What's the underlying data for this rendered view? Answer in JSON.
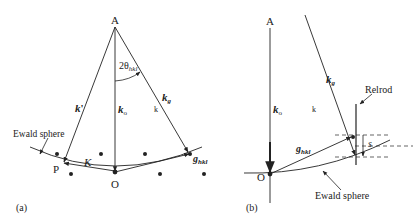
{
  "panel_a": {
    "label": "(a)",
    "points": {
      "A": "A",
      "O": "O",
      "P": "P"
    },
    "vectors": {
      "k_prime": "k",
      "k_prime_mark": "'",
      "k_o": "k",
      "k_o_sub": "o",
      "k_g": "k",
      "k_g_sub": "g",
      "k_plain": "k",
      "K": "K",
      "g_hkl": "g",
      "g_hkl_sub": "hkl"
    },
    "angle": {
      "prefix": "2θ",
      "sub": "hkl"
    },
    "ewald_label": "Ewald sphere"
  },
  "panel_b": {
    "label": "(b)",
    "points": {
      "A": "A",
      "O": "O"
    },
    "vectors": {
      "k_o": "k",
      "k_o_sub": "o",
      "k_g": "k",
      "k_g_sub": "g",
      "k_plain": "k",
      "g_hkl": "g",
      "g_hkl_sub": "hkl"
    },
    "relrod_label": "Relrod",
    "s_label": "s",
    "ewald_label": "Ewald sphere"
  }
}
